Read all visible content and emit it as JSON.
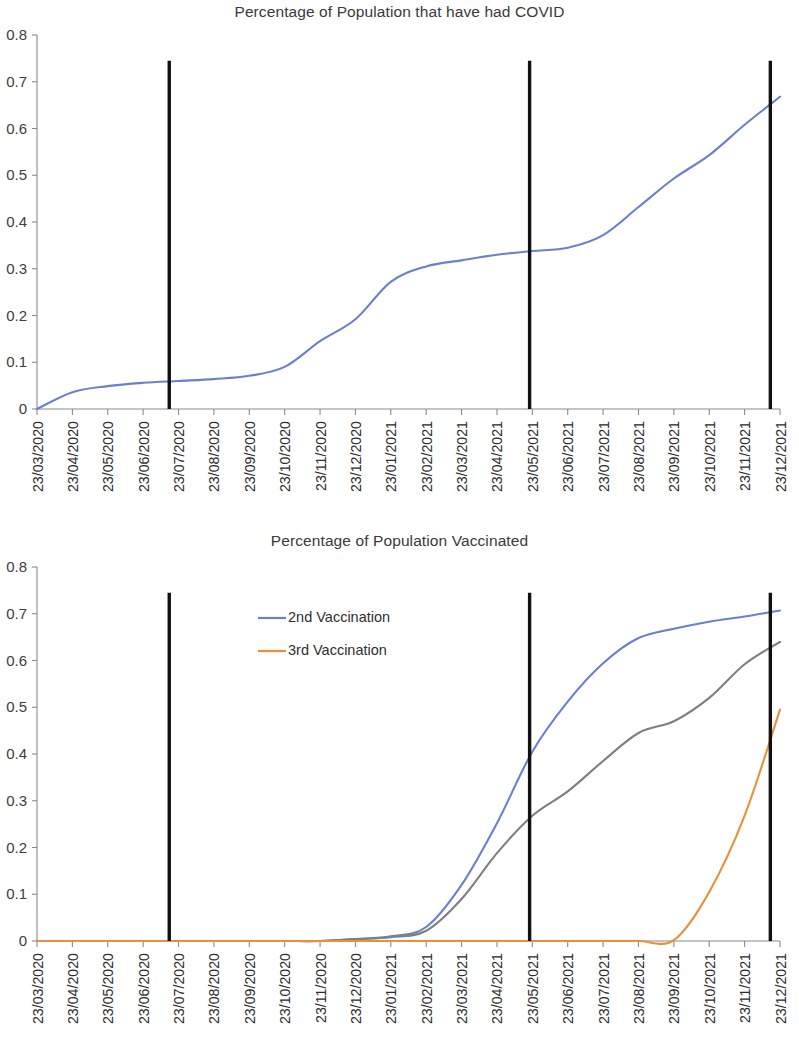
{
  "page": {
    "background": "#ffffff",
    "width": 799,
    "height": 1041
  },
  "charts": [
    {
      "id": "chart1",
      "title": "Percentage of Population that have had COVID"
    },
    {
      "id": "chart2",
      "title": "Percentage of Population Vaccinated"
    }
  ],
  "chart_data": [
    {
      "type": "line",
      "title": "Percentage of Population that have had COVID",
      "xlabel": "",
      "ylabel": "",
      "ylim": [
        0,
        0.8
      ],
      "ytick_labels": [
        "0.8",
        "0.7",
        "0.6",
        "0.5",
        "0.4",
        "0.3",
        "0.2",
        "0.1",
        "0"
      ],
      "ytick_values": [
        0.8,
        0.7,
        0.6,
        0.5,
        0.4,
        0.3,
        0.2,
        0.1,
        0
      ],
      "grid": false,
      "legend": null,
      "x": [
        "23/03/2020",
        "23/04/2020",
        "23/05/2020",
        "23/06/2020",
        "23/07/2020",
        "23/08/2020",
        "23/09/2020",
        "23/10/2020",
        "23/11/2020",
        "23/12/2020",
        "23/01/2021",
        "23/02/2021",
        "23/03/2021",
        "23/04/2021",
        "23/05/2021",
        "23/06/2021",
        "23/07/2021",
        "23/08/2021",
        "23/09/2021",
        "23/10/2021",
        "23/11/2021",
        "23/12/2021"
      ],
      "series": [
        {
          "name": "Percentage of population that have had COVID",
          "color": "#6a7fd0",
          "values": [
            0.0,
            0.036,
            0.049,
            0.056,
            0.06,
            0.064,
            0.071,
            0.09,
            0.145,
            0.192,
            0.272,
            0.305,
            0.318,
            0.33,
            0.338,
            0.345,
            0.372,
            0.432,
            0.493,
            0.543,
            0.608,
            0.668
          ]
        }
      ],
      "annotations": [
        {
          "type": "vertical-line",
          "label": "Lockdown 1",
          "x": "23/06/2020",
          "x_fraction": 0.178,
          "color": "#111111",
          "y_top": 0.745
        },
        {
          "type": "vertical-line",
          "label": "Lockdown 2",
          "x": "23/04/2021",
          "x_fraction": 0.663,
          "color": "#111111",
          "y_top": 0.745
        },
        {
          "type": "vertical-line",
          "label": "Lockdown 3",
          "x": "23/11/2021",
          "x_fraction": 0.987,
          "color": "#111111",
          "y_top": 0.745
        }
      ]
    },
    {
      "type": "line",
      "title": "Percentage of Population Vaccinated",
      "xlabel": "",
      "ylabel": "",
      "ylim": [
        0,
        0.8
      ],
      "ytick_labels": [
        "0.8",
        "0.7",
        "0.6",
        "0.5",
        "0.4",
        "0.3",
        "0.2",
        "0.1",
        "0"
      ],
      "ytick_values": [
        0.8,
        0.7,
        0.6,
        0.5,
        0.4,
        0.3,
        0.2,
        0.1,
        0
      ],
      "grid": false,
      "legend": {
        "position": "inside-top-left",
        "entries": [
          "2nd Vaccination",
          "3rd Vaccination"
        ]
      },
      "x": [
        "23/03/2020",
        "23/04/2020",
        "23/05/2020",
        "23/06/2020",
        "23/07/2020",
        "23/08/2020",
        "23/09/2020",
        "23/10/2020",
        "23/11/2020",
        "23/12/2020",
        "23/01/2021",
        "23/02/2021",
        "23/03/2021",
        "23/04/2021",
        "23/05/2021",
        "23/06/2021",
        "23/07/2021",
        "23/08/2021",
        "23/09/2021",
        "23/10/2021",
        "23/11/2021",
        "23/12/2021"
      ],
      "series": [
        {
          "name": "2nd Vaccination",
          "color": "#6a7fd0",
          "values": [
            0.0,
            0.0,
            0.0,
            0.0,
            0.0,
            0.0,
            0.0,
            0.0,
            0.0,
            0.004,
            0.01,
            0.03,
            0.12,
            0.252,
            0.405,
            0.512,
            0.594,
            0.648,
            0.668,
            0.683,
            0.694,
            0.707
          ]
        },
        {
          "name": "1st Vaccination",
          "color": "#7f7f7f",
          "values": [
            0.0,
            0.0,
            0.0,
            0.0,
            0.0,
            0.0,
            0.0,
            0.0,
            0.0,
            0.004,
            0.008,
            0.022,
            0.09,
            0.188,
            0.268,
            0.32,
            0.385,
            0.445,
            0.47,
            0.52,
            0.592,
            0.64
          ]
        },
        {
          "name": "3rd Vaccination",
          "color": "#e8903c",
          "values": [
            0.0,
            0.0,
            0.0,
            0.0,
            0.0,
            0.0,
            0.0,
            0.0,
            0.0,
            0.0,
            0.0,
            0.0,
            0.0,
            0.0,
            0.0,
            0.0,
            0.0,
            0.0,
            0.002,
            0.105,
            0.268,
            0.495
          ]
        }
      ],
      "annotations": [
        {
          "type": "vertical-line",
          "label": "Lockdown 1",
          "x": "23/06/2020",
          "x_fraction": 0.178,
          "color": "#111111",
          "y_top": 0.745
        },
        {
          "type": "vertical-line",
          "label": "Lockdown 2",
          "x": "23/04/2021",
          "x_fraction": 0.663,
          "color": "#111111",
          "y_top": 0.745
        },
        {
          "type": "vertical-line",
          "label": "Lockdown 3",
          "x": "23/11/2021",
          "x_fraction": 0.987,
          "color": "#111111",
          "y_top": 0.745
        }
      ]
    }
  ]
}
